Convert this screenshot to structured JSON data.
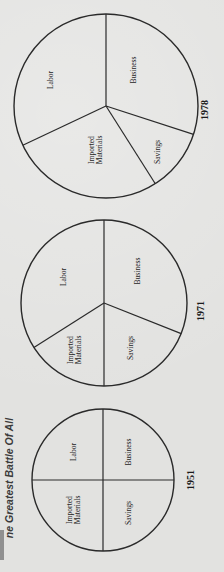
{
  "page": {
    "title": "ne Greatest Battle Of All"
  },
  "chart_data": [
    {
      "type": "pie",
      "title": "1951",
      "categories": [
        "Business",
        "Savings",
        "Imported Materials",
        "Labor"
      ],
      "values": [
        25,
        25,
        25,
        25
      ],
      "center": [
        103,
        480
      ],
      "radius": 71,
      "start_angle_deg": 90,
      "label_positions": [
        [
          128,
          452
        ],
        [
          128,
          513
        ],
        [
          73,
          510
        ],
        [
          73,
          452
        ]
      ],
      "year_position": [
        194,
        480
      ]
    },
    {
      "type": "pie",
      "title": "1971",
      "categories": [
        "Business",
        "Savings",
        "Imported Materials",
        "Labor"
      ],
      "values": [
        31,
        19,
        16,
        34
      ],
      "center": [
        104,
        303
      ],
      "radius": 83,
      "start_angle_deg": 90,
      "label_positions": [
        [
          137,
          271
        ],
        [
          130,
          348
        ],
        [
          74,
          350
        ],
        [
          63,
          277
        ]
      ],
      "year_position": [
        204,
        311
      ]
    },
    {
      "type": "pie",
      "title": "1978",
      "categories": [
        "Business",
        "Savings",
        "Imported Materials",
        "Labor"
      ],
      "values": [
        30,
        11,
        27,
        32
      ],
      "center": [
        106,
        106
      ],
      "radius": 92,
      "start_angle_deg": 90,
      "label_positions": [
        [
          133,
          70
        ],
        [
          157,
          152
        ],
        [
          95,
          150
        ],
        [
          50,
          80
        ]
      ],
      "year_position": [
        208,
        110
      ]
    }
  ]
}
